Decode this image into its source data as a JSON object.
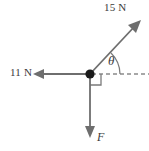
{
  "figure": {
    "type": "force-vector-diagram",
    "background_color": "#ffffff",
    "stroke_color": "#6e6e6e",
    "text_color": "#3a3a3a",
    "origin": {
      "x": 90,
      "y": 74
    },
    "labels": {
      "force_up_right": "15 N",
      "force_left": "11 N",
      "angle": "θ",
      "force_down": "F"
    },
    "vectors": [
      {
        "name": "force-15n",
        "label": "15 N",
        "magnitude": 15,
        "unit": "N",
        "direction": "up-right",
        "angle_from_horizontal": "θ",
        "tip": {
          "x": 140,
          "y": 22
        }
      },
      {
        "name": "force-11n",
        "label": "11 N",
        "magnitude": 11,
        "unit": "N",
        "direction": "left",
        "angle_from_horizontal": "180",
        "tip": {
          "x": 34,
          "y": 74
        }
      },
      {
        "name": "force-f",
        "label": "F",
        "magnitude": null,
        "unit": "N",
        "direction": "down",
        "angle_from_horizontal": "270",
        "tip": {
          "x": 90,
          "y": 137
        }
      }
    ],
    "reference_line": {
      "name": "horizontal-dashed-axis",
      "style": "dashed",
      "from": {
        "x": 90,
        "y": 74
      },
      "to": {
        "x": 149,
        "y": 74
      }
    },
    "angle_arc": {
      "name": "theta-arc",
      "label": "θ",
      "between": [
        "force-15n",
        "horizontal-dashed-axis"
      ]
    },
    "right_angle_marker": {
      "name": "right-angle-marker",
      "between": [
        "force-f",
        "horizontal-dashed-axis"
      ],
      "size": 10
    }
  }
}
